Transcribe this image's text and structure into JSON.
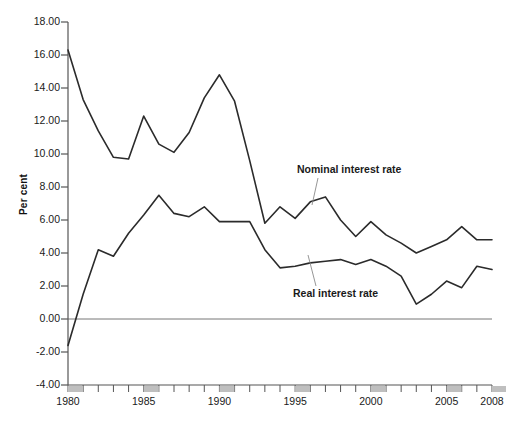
{
  "chart_data": {
    "type": "line",
    "title": "",
    "xlabel": "",
    "ylabel": "Per cent",
    "xlim": [
      1980,
      2008
    ],
    "ylim": [
      -4.0,
      18.0
    ],
    "grid": false,
    "legend_position": "inline-annotations",
    "yticks": [
      "18.00",
      "16.00",
      "14.00",
      "12.00",
      "10.00",
      "8.00",
      "6.00",
      "4.00",
      "2.00",
      "0.00",
      "-2.00",
      "-4.00"
    ],
    "ytick_values": [
      18,
      16,
      14,
      12,
      10,
      8,
      6,
      4,
      2,
      0,
      -2,
      -4
    ],
    "xticks": [
      "1980",
      "1985",
      "1990",
      "1995",
      "2000",
      "2005",
      "2008"
    ],
    "xtick_values": [
      1980,
      1985,
      1990,
      1995,
      2000,
      2005,
      2008
    ],
    "x": [
      1980,
      1981,
      1982,
      1983,
      1984,
      1985,
      1986,
      1987,
      1988,
      1989,
      1990,
      1991,
      1992,
      1993,
      1994,
      1995,
      1996,
      1997,
      1998,
      1999,
      2000,
      2001,
      2002,
      2003,
      2004,
      2005,
      2006,
      2007,
      2008
    ],
    "series": [
      {
        "name": "Nominal interest rate",
        "color": "#2b2b2b",
        "values": [
          16.3,
          13.3,
          11.4,
          9.8,
          9.7,
          12.3,
          10.6,
          10.1,
          11.3,
          13.4,
          14.8,
          13.2,
          9.6,
          5.8,
          6.8,
          6.1,
          7.1,
          7.4,
          6.0,
          5.0,
          5.9,
          5.1,
          4.6,
          4.0,
          4.4,
          4.8,
          5.6,
          4.8,
          4.8
        ]
      },
      {
        "name": "Real interest rate",
        "color": "#2b2b2b",
        "values": [
          -1.6,
          1.5,
          4.2,
          3.8,
          5.2,
          6.3,
          7.5,
          6.4,
          6.2,
          6.8,
          5.9,
          5.9,
          5.9,
          4.2,
          3.1,
          3.2,
          3.4,
          3.5,
          3.6,
          3.3,
          3.6,
          3.2,
          2.6,
          0.9,
          1.5,
          2.3,
          1.9,
          3.2,
          3.0
        ]
      }
    ],
    "annotations": [
      {
        "text": "Nominal interest rate",
        "x": 1998,
        "y": 9.2
      },
      {
        "text": "Real interest rate",
        "x": 1998,
        "y": 1.3
      }
    ],
    "axis_year_bands": [
      1980,
      1985,
      1990,
      1995,
      2000,
      2005,
      2008
    ],
    "zero_line": 0,
    "band_color": "#bfbfbf",
    "axis_color": "#555555",
    "line_color": "#2b2b2b"
  }
}
